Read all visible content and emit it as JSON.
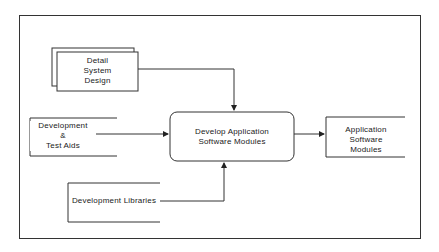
{
  "diagram": {
    "inputs": {
      "detail_system_design": {
        "label": "Detail\nSystem\nDesign"
      },
      "development_test_aids": {
        "label": "Development\n&\nTest  Aids"
      },
      "development_libraries": {
        "label": "Development  Libraries"
      }
    },
    "process": {
      "label": "Develop  Application\nSoftware  Modules"
    },
    "output": {
      "label": "Application    Software\nModules"
    }
  }
}
